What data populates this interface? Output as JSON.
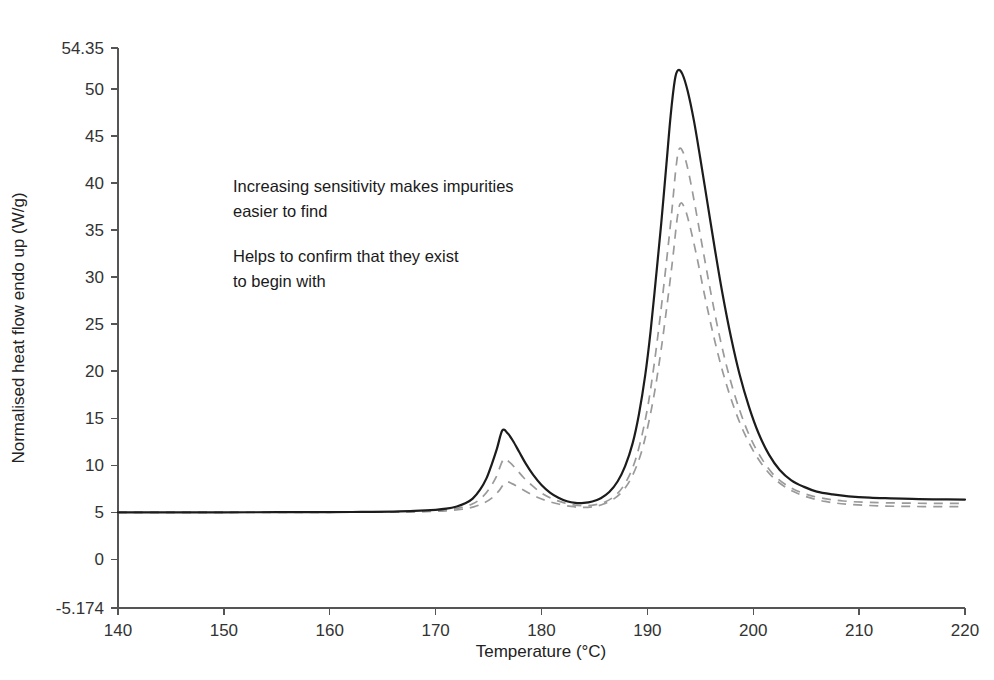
{
  "chart_data": {
    "type": "line",
    "title": "",
    "xlabel": "Temperature (°C)",
    "ylabel": "Normalised heat flow endo up (W/g)",
    "xlim": [
      140,
      220
    ],
    "ylim": [
      -5.174,
      54.35
    ],
    "xticks": [
      140,
      150,
      160,
      170,
      180,
      190,
      200,
      210,
      220
    ],
    "xtick_labels": [
      "140",
      "150",
      "160",
      "170",
      "180",
      "190",
      "200",
      "210",
      "220"
    ],
    "yticks": [
      -5.174,
      0,
      5,
      10,
      15,
      20,
      25,
      30,
      35,
      40,
      45,
      50,
      54.35
    ],
    "ytick_labels": [
      "-5.174",
      "0",
      "5",
      "10",
      "15",
      "20",
      "25",
      "30",
      "35",
      "40",
      "45",
      "50",
      "54.35"
    ],
    "grid": false,
    "legend": "none",
    "baseline": 5.0,
    "series": [
      {
        "name": "highest sensitivity",
        "style": "solid",
        "color": "#1c1c1c",
        "small_peak": {
          "x": 176.3,
          "y": 13.7
        },
        "main_peak": {
          "x": 192.7,
          "y": 52.0
        },
        "valley": {
          "x": 183.0,
          "y": 6.0
        },
        "points": [
          [
            140.0,
            5.0
          ],
          [
            145.0,
            5.0
          ],
          [
            150.0,
            5.0
          ],
          [
            155.0,
            5.01
          ],
          [
            160.0,
            5.02
          ],
          [
            163.0,
            5.04
          ],
          [
            166.0,
            5.08
          ],
          [
            168.0,
            5.14
          ],
          [
            170.0,
            5.26
          ],
          [
            171.0,
            5.38
          ],
          [
            172.0,
            5.62
          ],
          [
            172.8,
            5.95
          ],
          [
            173.5,
            6.45
          ],
          [
            174.2,
            7.4
          ],
          [
            174.8,
            8.6
          ],
          [
            175.3,
            10.1
          ],
          [
            175.8,
            11.8
          ],
          [
            176.3,
            13.7
          ],
          [
            176.8,
            13.4
          ],
          [
            177.3,
            12.6
          ],
          [
            177.9,
            11.4
          ],
          [
            178.5,
            10.2
          ],
          [
            179.2,
            9.0
          ],
          [
            180.0,
            7.9
          ],
          [
            180.8,
            7.1
          ],
          [
            181.6,
            6.55
          ],
          [
            182.4,
            6.18
          ],
          [
            183.2,
            6.0
          ],
          [
            184.0,
            6.0
          ],
          [
            184.8,
            6.15
          ],
          [
            185.6,
            6.5
          ],
          [
            186.4,
            7.15
          ],
          [
            187.2,
            8.3
          ],
          [
            187.9,
            9.9
          ],
          [
            188.6,
            12.3
          ],
          [
            189.2,
            15.4
          ],
          [
            189.8,
            19.6
          ],
          [
            190.3,
            24.2
          ],
          [
            190.8,
            29.8
          ],
          [
            191.3,
            35.6
          ],
          [
            191.8,
            42.0
          ],
          [
            192.2,
            47.2
          ],
          [
            192.6,
            51.0
          ],
          [
            192.9,
            52.0
          ],
          [
            193.3,
            51.6
          ],
          [
            193.8,
            49.8
          ],
          [
            194.4,
            46.6
          ],
          [
            195.0,
            42.6
          ],
          [
            195.7,
            37.7
          ],
          [
            196.4,
            32.8
          ],
          [
            197.1,
            28.2
          ],
          [
            197.9,
            23.6
          ],
          [
            198.7,
            19.7
          ],
          [
            199.6,
            16.2
          ],
          [
            200.5,
            13.4
          ],
          [
            201.5,
            11.1
          ],
          [
            202.5,
            9.5
          ],
          [
            203.6,
            8.4
          ],
          [
            204.8,
            7.7
          ],
          [
            206.0,
            7.2
          ],
          [
            207.5,
            6.9
          ],
          [
            209.0,
            6.7
          ],
          [
            211.0,
            6.55
          ],
          [
            213.0,
            6.48
          ],
          [
            215.0,
            6.42
          ],
          [
            217.0,
            6.38
          ],
          [
            220.0,
            6.35
          ]
        ]
      },
      {
        "name": "medium sensitivity",
        "style": "dashed",
        "color": "#9a9a9a",
        "small_peak": {
          "x": 176.4,
          "y": 10.6
        },
        "main_peak": {
          "x": 192.9,
          "y": 43.6
        },
        "valley": {
          "x": 183.2,
          "y": 5.7
        },
        "points": [
          [
            140.0,
            5.0
          ],
          [
            150.0,
            5.0
          ],
          [
            160.0,
            5.01
          ],
          [
            165.0,
            5.03
          ],
          [
            168.0,
            5.08
          ],
          [
            170.0,
            5.18
          ],
          [
            171.5,
            5.33
          ],
          [
            172.5,
            5.52
          ],
          [
            173.5,
            5.9
          ],
          [
            174.3,
            6.5
          ],
          [
            175.0,
            7.4
          ],
          [
            175.7,
            8.7
          ],
          [
            176.4,
            10.6
          ],
          [
            177.0,
            10.3
          ],
          [
            177.6,
            9.6
          ],
          [
            178.3,
            8.7
          ],
          [
            179.1,
            7.85
          ],
          [
            180.0,
            7.05
          ],
          [
            181.0,
            6.45
          ],
          [
            182.0,
            6.05
          ],
          [
            183.0,
            5.78
          ],
          [
            184.0,
            5.7
          ],
          [
            185.0,
            5.78
          ],
          [
            186.0,
            6.1
          ],
          [
            187.0,
            6.8
          ],
          [
            187.8,
            7.9
          ],
          [
            188.6,
            9.7
          ],
          [
            189.3,
            12.3
          ],
          [
            190.0,
            16.0
          ],
          [
            190.6,
            20.4
          ],
          [
            191.2,
            25.7
          ],
          [
            191.8,
            31.6
          ],
          [
            192.3,
            36.9
          ],
          [
            192.7,
            41.6
          ],
          [
            193.0,
            43.6
          ],
          [
            193.4,
            43.2
          ],
          [
            193.9,
            41.1
          ],
          [
            194.5,
            37.6
          ],
          [
            195.2,
            33.2
          ],
          [
            196.0,
            28.3
          ],
          [
            196.8,
            23.8
          ],
          [
            197.7,
            19.6
          ],
          [
            198.7,
            15.9
          ],
          [
            199.7,
            13.0
          ],
          [
            200.8,
            10.7
          ],
          [
            202.0,
            8.9
          ],
          [
            203.4,
            7.7
          ],
          [
            204.9,
            6.95
          ],
          [
            206.5,
            6.5
          ],
          [
            208.5,
            6.2
          ],
          [
            211.0,
            6.05
          ],
          [
            214.0,
            5.98
          ],
          [
            217.0,
            5.95
          ],
          [
            220.0,
            5.95
          ]
        ]
      },
      {
        "name": "lowest sensitivity",
        "style": "dashed",
        "color": "#9a9a9a",
        "small_peak": {
          "x": 176.6,
          "y": 8.2
        },
        "main_peak": {
          "x": 193.0,
          "y": 37.8
        },
        "valley": {
          "x": 183.4,
          "y": 5.5
        },
        "points": [
          [
            140.0,
            5.0
          ],
          [
            150.0,
            5.0
          ],
          [
            160.0,
            5.0
          ],
          [
            166.0,
            5.02
          ],
          [
            169.0,
            5.07
          ],
          [
            171.0,
            5.16
          ],
          [
            172.5,
            5.32
          ],
          [
            173.6,
            5.58
          ],
          [
            174.5,
            5.95
          ],
          [
            175.3,
            6.5
          ],
          [
            176.0,
            7.3
          ],
          [
            176.6,
            8.2
          ],
          [
            177.2,
            8.05
          ],
          [
            177.9,
            7.62
          ],
          [
            178.7,
            7.1
          ],
          [
            179.6,
            6.6
          ],
          [
            180.6,
            6.18
          ],
          [
            181.7,
            5.85
          ],
          [
            182.8,
            5.62
          ],
          [
            183.8,
            5.52
          ],
          [
            184.8,
            5.58
          ],
          [
            185.8,
            5.85
          ],
          [
            186.8,
            6.4
          ],
          [
            187.7,
            7.3
          ],
          [
            188.5,
            8.7
          ],
          [
            189.3,
            10.9
          ],
          [
            190.0,
            13.9
          ],
          [
            190.7,
            17.9
          ],
          [
            191.3,
            22.3
          ],
          [
            191.9,
            27.4
          ],
          [
            192.4,
            32.0
          ],
          [
            192.8,
            36.1
          ],
          [
            193.1,
            37.8
          ],
          [
            193.5,
            37.4
          ],
          [
            194.0,
            35.5
          ],
          [
            194.7,
            32.0
          ],
          [
            195.4,
            28.1
          ],
          [
            196.2,
            24.0
          ],
          [
            197.1,
            20.0
          ],
          [
            198.1,
            16.4
          ],
          [
            199.2,
            13.3
          ],
          [
            200.4,
            10.8
          ],
          [
            201.7,
            8.9
          ],
          [
            203.2,
            7.55
          ],
          [
            204.9,
            6.7
          ],
          [
            206.8,
            6.15
          ],
          [
            209.0,
            5.85
          ],
          [
            212.0,
            5.68
          ],
          [
            215.0,
            5.62
          ],
          [
            218.0,
            5.6
          ],
          [
            220.0,
            5.6
          ]
        ]
      }
    ],
    "annotations": [
      {
        "id": "annot-1-line-1",
        "text": "Increasing sensitivity makes impurities",
        "x": 233,
        "y": 192
      },
      {
        "id": "annot-1-line-2",
        "text": "easier to find",
        "x": 233,
        "y": 217
      },
      {
        "id": "annot-2-line-1",
        "text": "Helps to confirm that they exist",
        "x": 233,
        "y": 262
      },
      {
        "id": "annot-2-line-2",
        "text": "to begin with",
        "x": 233,
        "y": 287
      }
    ]
  },
  "colors": {
    "solid_curve": "#1c1c1c",
    "dashed_curve": "#9a9a9a",
    "axis": "#555555",
    "text": "#1a1a1a",
    "background": "#ffffff"
  }
}
